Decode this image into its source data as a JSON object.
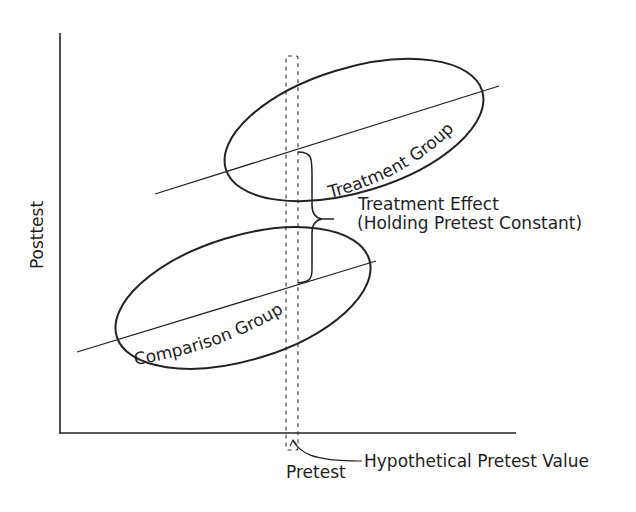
{
  "diagram": {
    "type": "regression-discontinuity-style ANCOVA illustration",
    "axes": {
      "y_label": "Posttest",
      "x_label": "Pretest"
    },
    "groups": {
      "treatment": {
        "label": "Treatment Group"
      },
      "comparison": {
        "label": "Comparison Group"
      }
    },
    "annotations": {
      "effect_line1": "Treatment Effect",
      "effect_line2": "(Holding Pretest Constant)",
      "pretest_value": "Hypothetical Pretest Value"
    },
    "colors": {
      "stroke": "#222222",
      "background": "#ffffff"
    }
  }
}
